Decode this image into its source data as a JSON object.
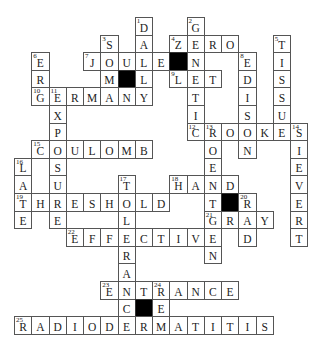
{
  "puzzle": {
    "type": "crossword",
    "grid_origin": {
      "x": 14,
      "y": 17
    },
    "cell_size": {
      "w": 17.25,
      "h": 17.6
    },
    "colors": {
      "cell_bg": "#ffffff",
      "block": "#000000",
      "line": "#555555",
      "text": "#222222"
    },
    "cells": [
      {
        "r": 0,
        "c": 7,
        "l": "D",
        "n": "1"
      },
      {
        "r": 0,
        "c": 10,
        "l": "G",
        "n": "2"
      },
      {
        "r": 1,
        "c": 5,
        "l": "S",
        "n": "3"
      },
      {
        "r": 1,
        "c": 7,
        "l": "A"
      },
      {
        "r": 1,
        "c": 9,
        "l": "Z",
        "n": "4"
      },
      {
        "r": 1,
        "c": 10,
        "l": "E"
      },
      {
        "r": 1,
        "c": 11,
        "l": "R"
      },
      {
        "r": 1,
        "c": 12,
        "l": "O"
      },
      {
        "r": 1,
        "c": 15,
        "l": "T",
        "n": "5"
      },
      {
        "r": 2,
        "c": 1,
        "l": "E",
        "n": "6"
      },
      {
        "r": 2,
        "c": 4,
        "l": "J",
        "n": "7"
      },
      {
        "r": 2,
        "c": 5,
        "l": "O"
      },
      {
        "r": 2,
        "c": 6,
        "l": "U"
      },
      {
        "r": 2,
        "c": 7,
        "l": "L"
      },
      {
        "r": 2,
        "c": 8,
        "l": "E"
      },
      {
        "r": 2,
        "c": 9,
        "block": true
      },
      {
        "r": 2,
        "c": 10,
        "l": "N"
      },
      {
        "r": 2,
        "c": 13,
        "l": "E",
        "n": "8"
      },
      {
        "r": 2,
        "c": 15,
        "l": "I"
      },
      {
        "r": 3,
        "c": 1,
        "l": "R"
      },
      {
        "r": 3,
        "c": 5,
        "l": "M"
      },
      {
        "r": 3,
        "c": 6,
        "block": true
      },
      {
        "r": 3,
        "c": 7,
        "l": "L"
      },
      {
        "r": 3,
        "c": 9,
        "l": "L",
        "n": "9"
      },
      {
        "r": 3,
        "c": 10,
        "l": "E"
      },
      {
        "r": 3,
        "c": 11,
        "l": "T"
      },
      {
        "r": 3,
        "c": 13,
        "l": "D"
      },
      {
        "r": 3,
        "c": 15,
        "l": "S"
      },
      {
        "r": 4,
        "c": 1,
        "l": "G",
        "n": "10"
      },
      {
        "r": 4,
        "c": 2,
        "l": "E",
        "n": "11"
      },
      {
        "r": 4,
        "c": 3,
        "l": "R"
      },
      {
        "r": 4,
        "c": 4,
        "l": "M"
      },
      {
        "r": 4,
        "c": 5,
        "l": "A"
      },
      {
        "r": 4,
        "c": 6,
        "l": "N"
      },
      {
        "r": 4,
        "c": 7,
        "l": "Y"
      },
      {
        "r": 4,
        "c": 10,
        "l": "T"
      },
      {
        "r": 4,
        "c": 13,
        "l": "I"
      },
      {
        "r": 4,
        "c": 15,
        "l": "S"
      },
      {
        "r": 5,
        "c": 2,
        "l": "X"
      },
      {
        "r": 5,
        "c": 10,
        "l": "I"
      },
      {
        "r": 5,
        "c": 13,
        "l": "S"
      },
      {
        "r": 5,
        "c": 15,
        "l": "U"
      },
      {
        "r": 6,
        "c": 2,
        "l": "P"
      },
      {
        "r": 6,
        "c": 10,
        "l": "C",
        "n": "12"
      },
      {
        "r": 6,
        "c": 11,
        "l": "R",
        "n": "13"
      },
      {
        "r": 6,
        "c": 12,
        "l": "O"
      },
      {
        "r": 6,
        "c": 13,
        "l": "O"
      },
      {
        "r": 6,
        "c": 14,
        "l": "K"
      },
      {
        "r": 6,
        "c": 15,
        "l": "E"
      },
      {
        "r": 6,
        "c": 16,
        "l": "S",
        "n": "14"
      },
      {
        "r": 7,
        "c": 1,
        "l": "C",
        "n": "15"
      },
      {
        "r": 7,
        "c": 2,
        "l": "O"
      },
      {
        "r": 7,
        "c": 3,
        "l": "U"
      },
      {
        "r": 7,
        "c": 4,
        "l": "L"
      },
      {
        "r": 7,
        "c": 5,
        "l": "O"
      },
      {
        "r": 7,
        "c": 6,
        "l": "M"
      },
      {
        "r": 7,
        "c": 7,
        "l": "B"
      },
      {
        "r": 7,
        "c": 11,
        "l": "O"
      },
      {
        "r": 7,
        "c": 13,
        "l": "N"
      },
      {
        "r": 7,
        "c": 16,
        "l": "I"
      },
      {
        "r": 8,
        "c": 0,
        "l": "L",
        "n": "16"
      },
      {
        "r": 8,
        "c": 2,
        "l": "S"
      },
      {
        "r": 8,
        "c": 11,
        "l": "E"
      },
      {
        "r": 8,
        "c": 16,
        "l": "E"
      },
      {
        "r": 9,
        "c": 0,
        "l": "A"
      },
      {
        "r": 9,
        "c": 2,
        "l": "U"
      },
      {
        "r": 9,
        "c": 6,
        "l": "T",
        "n": "17"
      },
      {
        "r": 9,
        "c": 9,
        "l": "H",
        "n": "18"
      },
      {
        "r": 9,
        "c": 10,
        "l": "A"
      },
      {
        "r": 9,
        "c": 11,
        "l": "N"
      },
      {
        "r": 9,
        "c": 12,
        "l": "D"
      },
      {
        "r": 9,
        "c": 16,
        "l": "V"
      },
      {
        "r": 10,
        "c": 0,
        "l": "T",
        "n": "19"
      },
      {
        "r": 10,
        "c": 1,
        "l": "H"
      },
      {
        "r": 10,
        "c": 2,
        "l": "R"
      },
      {
        "r": 10,
        "c": 3,
        "l": "E"
      },
      {
        "r": 10,
        "c": 4,
        "l": "S"
      },
      {
        "r": 10,
        "c": 5,
        "l": "H"
      },
      {
        "r": 10,
        "c": 6,
        "l": "O"
      },
      {
        "r": 10,
        "c": 7,
        "l": "L"
      },
      {
        "r": 10,
        "c": 8,
        "l": "D"
      },
      {
        "r": 10,
        "c": 11,
        "l": "T"
      },
      {
        "r": 10,
        "c": 12,
        "block": true
      },
      {
        "r": 10,
        "c": 13,
        "l": "R",
        "n": "20"
      },
      {
        "r": 10,
        "c": 16,
        "l": "E"
      },
      {
        "r": 11,
        "c": 0,
        "l": "E"
      },
      {
        "r": 11,
        "c": 2,
        "l": "E"
      },
      {
        "r": 11,
        "c": 6,
        "l": "L"
      },
      {
        "r": 11,
        "c": 11,
        "l": "G",
        "n": "21"
      },
      {
        "r": 11,
        "c": 12,
        "l": "R"
      },
      {
        "r": 11,
        "c": 13,
        "l": "A"
      },
      {
        "r": 11,
        "c": 14,
        "l": "Y"
      },
      {
        "r": 11,
        "c": 16,
        "l": "R"
      },
      {
        "r": 12,
        "c": 3,
        "l": "E",
        "n": "22"
      },
      {
        "r": 12,
        "c": 4,
        "l": "F"
      },
      {
        "r": 12,
        "c": 5,
        "l": "F"
      },
      {
        "r": 12,
        "c": 6,
        "l": "E"
      },
      {
        "r": 12,
        "c": 7,
        "l": "C"
      },
      {
        "r": 12,
        "c": 8,
        "l": "T"
      },
      {
        "r": 12,
        "c": 9,
        "l": "I"
      },
      {
        "r": 12,
        "c": 10,
        "l": "V"
      },
      {
        "r": 12,
        "c": 11,
        "l": "E"
      },
      {
        "r": 12,
        "c": 13,
        "l": "D"
      },
      {
        "r": 12,
        "c": 16,
        "l": "T"
      },
      {
        "r": 13,
        "c": 6,
        "l": "R"
      },
      {
        "r": 13,
        "c": 11,
        "l": "N"
      },
      {
        "r": 14,
        "c": 6,
        "l": "A"
      },
      {
        "r": 15,
        "c": 5,
        "l": "E",
        "n": "23"
      },
      {
        "r": 15,
        "c": 6,
        "l": "N"
      },
      {
        "r": 15,
        "c": 7,
        "l": "T"
      },
      {
        "r": 15,
        "c": 8,
        "l": "R",
        "n": "24"
      },
      {
        "r": 15,
        "c": 9,
        "l": "A"
      },
      {
        "r": 15,
        "c": 10,
        "l": "N"
      },
      {
        "r": 15,
        "c": 11,
        "l": "C"
      },
      {
        "r": 15,
        "c": 12,
        "l": "E"
      },
      {
        "r": 16,
        "c": 6,
        "l": "C"
      },
      {
        "r": 16,
        "c": 7,
        "block": true
      },
      {
        "r": 16,
        "c": 8,
        "l": "E"
      },
      {
        "r": 17,
        "c": 0,
        "l": "R",
        "n": "25"
      },
      {
        "r": 17,
        "c": 1,
        "l": "A"
      },
      {
        "r": 17,
        "c": 2,
        "l": "D"
      },
      {
        "r": 17,
        "c": 3,
        "l": "I"
      },
      {
        "r": 17,
        "c": 4,
        "l": "O"
      },
      {
        "r": 17,
        "c": 5,
        "l": "D"
      },
      {
        "r": 17,
        "c": 6,
        "l": "E"
      },
      {
        "r": 17,
        "c": 7,
        "l": "R"
      },
      {
        "r": 17,
        "c": 8,
        "l": "M"
      },
      {
        "r": 17,
        "c": 9,
        "l": "A"
      },
      {
        "r": 17,
        "c": 10,
        "l": "T"
      },
      {
        "r": 17,
        "c": 11,
        "l": "I"
      },
      {
        "r": 17,
        "c": 12,
        "l": "T"
      },
      {
        "r": 17,
        "c": 13,
        "l": "I"
      },
      {
        "r": 17,
        "c": 14,
        "l": "S"
      }
    ],
    "answers": {
      "across": [
        {
          "n": "4",
          "word": "ZERO"
        },
        {
          "n": "7",
          "word": "JOULE"
        },
        {
          "n": "9",
          "word": "LET"
        },
        {
          "n": "10",
          "word": "GERMANY"
        },
        {
          "n": "12",
          "word": "CROOKES"
        },
        {
          "n": "15",
          "word": "COULOMB"
        },
        {
          "n": "18",
          "word": "HAND"
        },
        {
          "n": "19",
          "word": "THRESHOLD"
        },
        {
          "n": "21",
          "word": "GRAY"
        },
        {
          "n": "22",
          "word": "EFFECTIVE"
        },
        {
          "n": "23",
          "word": "ENTRANCE"
        },
        {
          "n": "25",
          "word": "RADIODERMATITIS"
        }
      ],
      "down": [
        {
          "n": "1",
          "word": "DALLY"
        },
        {
          "n": "2",
          "word": "GENETIC"
        },
        {
          "n": "3",
          "word": "SOMA"
        },
        {
          "n": "5",
          "word": "TISSUE"
        },
        {
          "n": "6",
          "word": "ERG"
        },
        {
          "n": "8",
          "word": "EDISON"
        },
        {
          "n": "11",
          "word": "EXPOSURE"
        },
        {
          "n": "13",
          "word": "ROENTGEN"
        },
        {
          "n": "14",
          "word": "SIEVERT"
        },
        {
          "n": "16",
          "word": "LATE"
        },
        {
          "n": "17",
          "word": "TOLERANCE"
        },
        {
          "n": "20",
          "word": "RAD"
        },
        {
          "n": "24",
          "word": "REM"
        }
      ]
    }
  }
}
